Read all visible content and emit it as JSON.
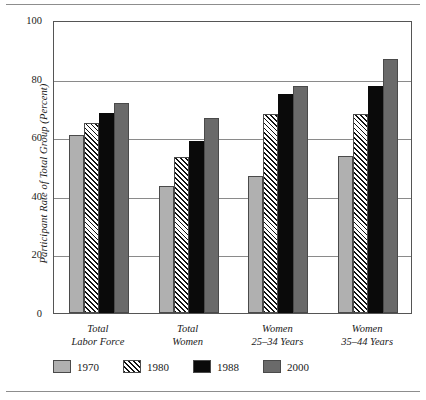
{
  "chart_data": {
    "type": "bar",
    "title": "",
    "subtitle": "",
    "xlabel": "",
    "ylabel": "Participant Rate of Total Group (Percent)",
    "ylim": [
      0,
      100
    ],
    "ytick_labels": [
      "0",
      "20",
      "40",
      "60",
      "80",
      "100"
    ],
    "ytick_values": [
      0,
      20,
      40,
      60,
      80,
      100
    ],
    "grid": "horizontal",
    "legend_position": "bottom-left",
    "categories": [
      "Total\nLabor Force",
      "Total\nWomen",
      "Women\n25–34 Years",
      "Women\n35–44 Years"
    ],
    "category_lines": [
      [
        "Total",
        "Labor Force"
      ],
      [
        "Total",
        "Women"
      ],
      [
        "Women",
        "25–34 Years"
      ],
      [
        "Women",
        "35–44 Years"
      ]
    ],
    "series": [
      {
        "name": "1970",
        "color": "#b0b0b0",
        "pattern": "solid",
        "values": [
          60.9,
          43.4,
          46.6,
          53.5
        ]
      },
      {
        "name": "1980",
        "color": "#ffffff",
        "pattern": "diagonal-hatch",
        "values": [
          64.8,
          53.4,
          67.9,
          67.9
        ]
      },
      {
        "name": "1988",
        "color": "#0a0a0a",
        "pattern": "solid",
        "values": [
          68.3,
          58.6,
          74.6,
          77.4
        ]
      },
      {
        "name": "2000",
        "color": "#6a6a6a",
        "pattern": "solid",
        "values": [
          71.8,
          66.6,
          77.4,
          86.8
        ]
      }
    ]
  },
  "style": {
    "axis_color": "#555555",
    "gridline_color": "#8a8a8a",
    "rule_color": "#8d8d8d",
    "bar_edge_color": "#4a4a4a",
    "background": "#ffffff"
  }
}
